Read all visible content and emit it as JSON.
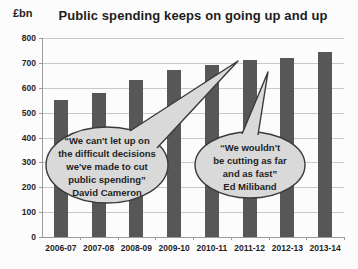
{
  "chart_data": {
    "type": "bar",
    "title": "Public spending keeps on going up and up",
    "ylabel": "£bn",
    "xlabel": "",
    "categories": [
      "2006-07",
      "2007-08",
      "2008-09",
      "2009-10",
      "2010-11",
      "2011-12",
      "2012-13",
      "2013-14"
    ],
    "values": [
      550,
      580,
      630,
      670,
      690,
      710,
      720,
      745
    ],
    "ylim": [
      0,
      800
    ],
    "ytick_step": 100,
    "grid": true,
    "legend": false,
    "bar_color": "#575757",
    "gridline_color": "#c9c9c9",
    "axis_color": "#9b9b9b",
    "annotations": [
      {
        "id": "cameron",
        "shape": "oval-callout",
        "lines": [
          "“We can't let up on",
          "the difficult decisions",
          "we've made to cut",
          "public spending”"
        ],
        "attribution": "David Cameron",
        "target_category": "2011-12",
        "fill": "#d9d9d9",
        "stroke": "#3a3a3a",
        "cx": 107,
        "cy": 165,
        "rx": 61,
        "ry": 38,
        "tail": [
          [
            130,
            131
          ],
          [
            157,
            148
          ],
          [
            238,
            61
          ]
        ]
      },
      {
        "id": "miliband",
        "shape": "oval-callout",
        "lines": [
          "“We wouldn't",
          "be cutting as far",
          "and as fast”"
        ],
        "attribution": "Ed Miliband",
        "target_category": "2012-13",
        "fill": "#d9d9d9",
        "stroke": "#3a3a3a",
        "cx": 250,
        "cy": 165,
        "rx": 55,
        "ry": 33,
        "tail": [
          [
            242,
            134
          ],
          [
            258,
            135
          ],
          [
            268,
            72
          ]
        ]
      }
    ]
  }
}
